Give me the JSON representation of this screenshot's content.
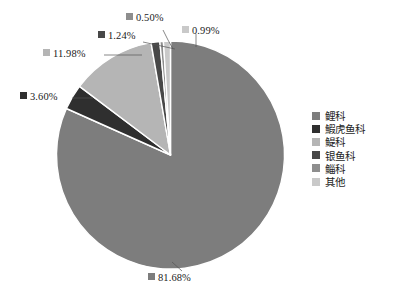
{
  "chart_data": {
    "type": "pie",
    "title": "",
    "labels": [
      "鲤科",
      "鰕虎鱼科",
      "鳀科",
      "银鱼科",
      "鲻科",
      "其他"
    ],
    "values": [
      81.68,
      3.6,
      11.98,
      1.24,
      0.5,
      0.99
    ],
    "value_labels": [
      "81.68%",
      "3.60%",
      "11.98%",
      "1.24%",
      "0.50%",
      "0.99%"
    ],
    "colors": [
      "#7d7d7d",
      "#2f2f2f",
      "#b5b5b5",
      "#484848",
      "#8e8e8e",
      "#c9c9c9"
    ],
    "units": "percent",
    "start_angle_deg": 0,
    "direction": "clockwise",
    "legend_position": "right",
    "label_position": "outside-with-leader-lines",
    "grid": false
  },
  "legend": {
    "items": [
      {
        "label": "鲤科",
        "color": "#7d7d7d"
      },
      {
        "label": "鰕虎鱼科",
        "color": "#2f2f2f"
      },
      {
        "label": "鳀科",
        "color": "#b5b5b5"
      },
      {
        "label": "银鱼科",
        "color": "#484848"
      },
      {
        "label": "鲻科",
        "color": "#8e8e8e"
      },
      {
        "label": "其他",
        "color": "#c9c9c9"
      }
    ]
  },
  "callouts": [
    {
      "name": "slice-label-qita",
      "text": "0.99%",
      "color": "#c9c9c9"
    },
    {
      "name": "slice-label-ziyu",
      "text": "0.50%",
      "color": "#8e8e8e"
    },
    {
      "name": "slice-label-yinyu",
      "text": "1.24%",
      "color": "#484848"
    },
    {
      "name": "slice-label-tiji",
      "text": "11.98%",
      "color": "#b5b5b5"
    },
    {
      "name": "slice-label-xiahu",
      "text": "3.60%",
      "color": "#2f2f2f"
    },
    {
      "name": "slice-label-liki",
      "text": "81.68%",
      "color": "#7d7d7d"
    }
  ]
}
